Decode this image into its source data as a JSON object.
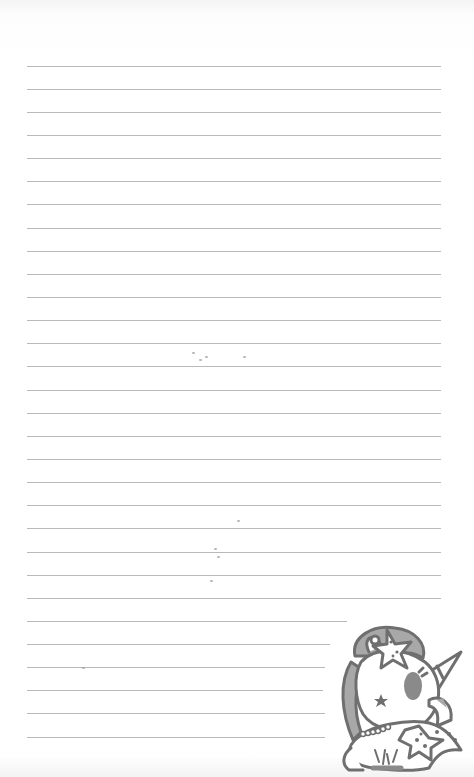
{
  "page": {
    "type": "lined notebook page",
    "background": "#ffffff",
    "rule_color": "#b9b9b9",
    "rule_left": 27,
    "rule_count": 30,
    "rules": [
      {
        "y": 66,
        "right": 441
      },
      {
        "y": 89,
        "right": 441
      },
      {
        "y": 112,
        "right": 441
      },
      {
        "y": 135,
        "right": 441
      },
      {
        "y": 158,
        "right": 441
      },
      {
        "y": 181,
        "right": 441
      },
      {
        "y": 204,
        "right": 441
      },
      {
        "y": 228,
        "right": 441
      },
      {
        "y": 251,
        "right": 441
      },
      {
        "y": 274,
        "right": 441
      },
      {
        "y": 297,
        "right": 441
      },
      {
        "y": 320,
        "right": 441
      },
      {
        "y": 343,
        "right": 441
      },
      {
        "y": 366,
        "right": 441
      },
      {
        "y": 390,
        "right": 441
      },
      {
        "y": 413,
        "right": 441
      },
      {
        "y": 436,
        "right": 441
      },
      {
        "y": 459,
        "right": 441
      },
      {
        "y": 482,
        "right": 441
      },
      {
        "y": 505,
        "right": 441
      },
      {
        "y": 528,
        "right": 441
      },
      {
        "y": 552,
        "right": 441
      },
      {
        "y": 575,
        "right": 441
      },
      {
        "y": 598,
        "right": 441
      },
      {
        "y": 621,
        "right": 347
      },
      {
        "y": 644,
        "right": 330
      },
      {
        "y": 667,
        "right": 325
      },
      {
        "y": 690,
        "right": 323
      },
      {
        "y": 713,
        "right": 325
      },
      {
        "y": 737,
        "right": 325
      }
    ]
  },
  "illustration": {
    "subject": "unicorn-mermaid with starfish hair clip and pearl necklace",
    "line_color": "#6f6f6f",
    "fill_color": "#9a9a9a"
  }
}
